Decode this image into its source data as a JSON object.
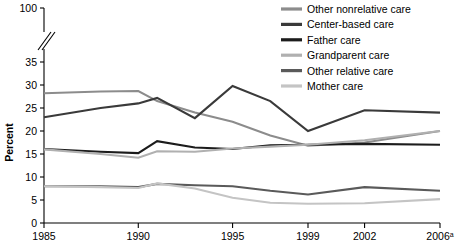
{
  "chart_data": {
    "type": "line",
    "title": "",
    "xlabel": "",
    "ylabel": "Percent",
    "x": [
      1985,
      1988,
      1990,
      1991,
      1993,
      1995,
      1997,
      1999,
      2002,
      2006
    ],
    "x_tick_values": [
      1985,
      1990,
      1995,
      1999,
      2002,
      2006
    ],
    "x_tick_labels": [
      "1985",
      "1990",
      "1995",
      "1999",
      "2002",
      "2006"
    ],
    "x_tick_label_superscripts": [
      "",
      "",
      "",
      "",
      "",
      "a"
    ],
    "y_tick_values": [
      0,
      5,
      10,
      15,
      20,
      25,
      30,
      35,
      100
    ],
    "y_tick_labels": [
      "0",
      "5",
      "10",
      "15",
      "20",
      "25",
      "30",
      "35",
      "100"
    ],
    "ylim": [
      0,
      37
    ],
    "axis_break": true,
    "axis_break_note": "y-axis broken between 35 and 100",
    "grid": false,
    "legend_position": "top-right",
    "series": [
      {
        "name": "Other nonrelative care",
        "color": "#8c8c8c",
        "values": [
          28.2,
          28.6,
          28.7,
          26.5,
          24.0,
          22.0,
          19.0,
          16.8,
          17.5,
          20.0
        ]
      },
      {
        "name": "Center-based care",
        "color": "#3a3a3a",
        "values": [
          23.0,
          25.0,
          26.0,
          27.2,
          22.8,
          29.8,
          26.5,
          20.0,
          24.5,
          24.0
        ]
      },
      {
        "name": "Father care",
        "color": "#1c1c1c",
        "values": [
          16.1,
          15.5,
          15.2,
          17.8,
          16.4,
          16.1,
          16.9,
          17.0,
          17.2,
          17.0
        ]
      },
      {
        "name": "Grandparent care",
        "color": "#b0b0b0",
        "values": [
          16.0,
          15.0,
          14.2,
          15.6,
          15.5,
          16.2,
          16.6,
          17.0,
          18.0,
          20.0
        ]
      },
      {
        "name": "Other relative care",
        "color": "#5a5a5a",
        "values": [
          8.0,
          8.0,
          7.8,
          8.5,
          8.2,
          8.0,
          7.0,
          6.2,
          7.8,
          7.0
        ]
      },
      {
        "name": "Mother care",
        "color": "#c4c4c4",
        "values": [
          8.0,
          7.8,
          7.6,
          8.6,
          7.5,
          5.5,
          4.4,
          4.2,
          4.3,
          5.2
        ]
      }
    ]
  },
  "legend": {
    "items": [
      {
        "label": "Other nonrelative care",
        "color": "#8c8c8c"
      },
      {
        "label": "Center-based care",
        "color": "#3a3a3a"
      },
      {
        "label": "Father care",
        "color": "#1c1c1c"
      },
      {
        "label": "Grandparent care",
        "color": "#b0b0b0"
      },
      {
        "label": "Other relative care",
        "color": "#5a5a5a"
      },
      {
        "label": "Mother care",
        "color": "#c4c4c4"
      }
    ]
  }
}
